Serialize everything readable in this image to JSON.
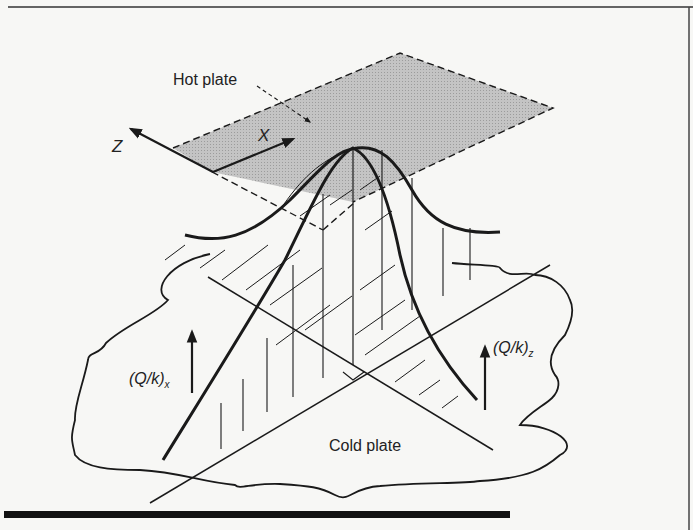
{
  "figure": {
    "labels": {
      "hot_plate": "Hot plate",
      "cold_plate": "Cold plate",
      "axis_z": "Z",
      "axis_x": "X",
      "heat_flux_x": "(Q/k)",
      "heat_flux_x_sub": "x",
      "heat_flux_z": "(Q/k)",
      "heat_flux_z_sub": "z"
    },
    "colors": {
      "ink": "#1a1a1a",
      "hot_plate_fill": "#b9b9b9",
      "background": "#f7f7f5",
      "bottom_rule": "#111111"
    }
  }
}
